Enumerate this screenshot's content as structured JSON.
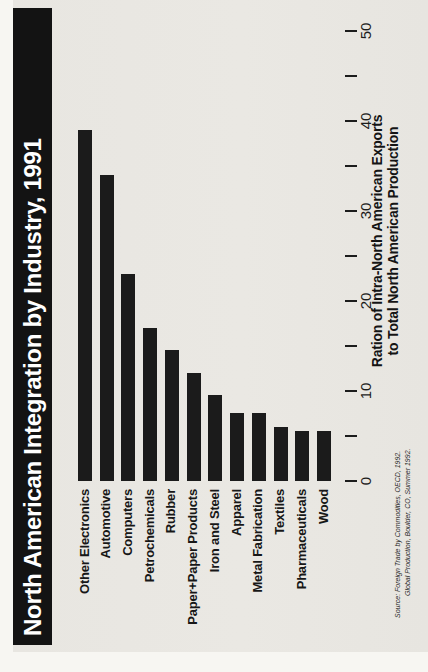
{
  "title": {
    "text": "North American Integration by Industry, 1991",
    "band_color": "#131313",
    "text_color": "#ffffff"
  },
  "chart_data": {
    "type": "bar",
    "title": "North American Integration by Industry, 1991",
    "orientation": "horizontal",
    "rotation": "entire chart scanned rotated 90 degrees counterclockwise (title band on left, value axis on right reading bottom-to-top)",
    "categories": [
      "Other Electronics",
      "Automotive",
      "Computers",
      "Petrochemicals",
      "Rubber",
      "Paper+Paper Products",
      "Iron and Steel",
      "Apparel",
      "Metal Fabrication",
      "Textiles",
      "Pharmaceuticals",
      "Wood"
    ],
    "values": [
      39,
      34,
      23,
      17,
      14.5,
      12,
      9.5,
      7.5,
      7.5,
      6,
      5.5,
      5.5
    ],
    "xlabel_line1": "Ration of Intra-North American Exports",
    "xlabel_line2": "to Total North American Production",
    "ylabel": "",
    "xlim": [
      0,
      50
    ],
    "xticks": [
      0,
      10,
      20,
      30,
      40,
      50
    ],
    "minor_xticks": [
      5,
      15,
      25,
      35,
      45
    ],
    "grid": false,
    "legend": false,
    "bar_color": "#1b1b1b"
  },
  "source": {
    "line1": "Source: Foreign Trade by Commodities, OECD, 1992.",
    "line2": "Global Production, Boulder, CO, Summer 1992."
  },
  "colors": {
    "paper": "#e9e7e2",
    "page_margin": "#f7f6f2",
    "ink": "#1a1a1a"
  }
}
